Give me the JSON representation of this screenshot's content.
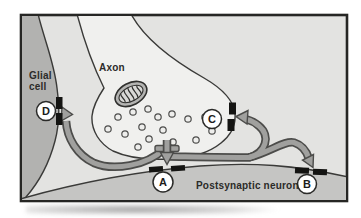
{
  "diagram": {
    "kind": "synapse-anatomy-figure",
    "labels": {
      "axon": "Axon",
      "glial_line1": "Glial",
      "glial_line2": "cell",
      "postsynaptic": "Postsynaptic neuron"
    },
    "sites": {
      "a": "A",
      "b": "B",
      "c": "C",
      "d": "D"
    },
    "colors": {
      "panel_background": "#e3e3e1",
      "glial_cell": "#b2b2b0",
      "postsynaptic_neuron": "#c5c5c3",
      "axon_terminal": "#f0f0ee",
      "membrane_line": "#3a3a38",
      "arrow_fill": "#a0a09e",
      "arrow_outline": "#4c4c4a",
      "receptor_block": "#141412",
      "frame_border": "#262624",
      "marker_circle_fill": "#ffffff"
    }
  }
}
